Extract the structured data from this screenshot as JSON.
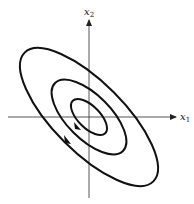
{
  "diagram": {
    "axes": {
      "x": {
        "label": "x",
        "subscript": "1"
      },
      "y": {
        "label": "x",
        "subscript": "2"
      }
    },
    "origin": [
      89,
      117
    ],
    "rotation_deg": 45,
    "contours": [
      {
        "name": "outer",
        "rx": 91,
        "ry": 35
      },
      {
        "name": "middle",
        "rx": 48,
        "ry": 22
      },
      {
        "name": "inner",
        "rx": 23,
        "ry": 11
      }
    ],
    "arrows": [
      {
        "on": "middle",
        "at": [
          78,
          126
        ],
        "direction": "down-right"
      },
      {
        "on": "outer",
        "at": [
          68,
          140
        ],
        "direction": "down-right"
      }
    ],
    "colors": {
      "stroke": "#111111",
      "axis": "#333333",
      "background": "#ffffff"
    }
  }
}
